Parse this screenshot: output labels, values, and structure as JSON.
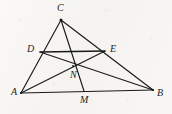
{
  "figure": {
    "kind": "euclidean-geometry-diagram",
    "canvas": {
      "width": 172,
      "height": 114
    },
    "background_color": "#f7f6f4",
    "stroke_color": "#1a1a1a",
    "label_color": "#1c1c1c",
    "points": [
      {
        "id": "A",
        "label": "A",
        "x": 21,
        "y": 93,
        "label_x": 11,
        "label_y": 87
      },
      {
        "id": "B",
        "label": "B",
        "x": 153,
        "y": 90,
        "label_x": 157,
        "label_y": 88
      },
      {
        "id": "C",
        "label": "C",
        "x": 61,
        "y": 20,
        "label_x": 57,
        "label_y": 3
      },
      {
        "id": "D",
        "label": "D",
        "x": 40,
        "y": 52,
        "label_x": 27,
        "label_y": 44
      },
      {
        "id": "E",
        "label": "E",
        "x": 105,
        "y": 51,
        "label_x": 110,
        "label_y": 44
      },
      {
        "id": "M",
        "label": "M",
        "x": 84,
        "y": 91,
        "label_x": 80,
        "label_y": 95
      },
      {
        "id": "N",
        "label": "N",
        "x": 73,
        "y": 66,
        "label_x": 70,
        "label_y": 70
      }
    ],
    "segments": [
      {
        "id": "AB",
        "name": "side-ab",
        "from": "A",
        "to": "B"
      },
      {
        "id": "AC",
        "name": "side-ac",
        "from": "A",
        "to": "C"
      },
      {
        "id": "CB",
        "name": "side-cb",
        "from": "C",
        "to": "B"
      },
      {
        "id": "DE",
        "name": "midsegment-de",
        "from": "D",
        "to": "E"
      },
      {
        "id": "CM",
        "name": "cevian-cm",
        "from": "C",
        "to": "M"
      },
      {
        "id": "AE",
        "name": "cevian-ae",
        "from": "A",
        "to": "E"
      },
      {
        "id": "DB",
        "name": "cevian-db",
        "from": "D",
        "to": "B"
      }
    ]
  }
}
